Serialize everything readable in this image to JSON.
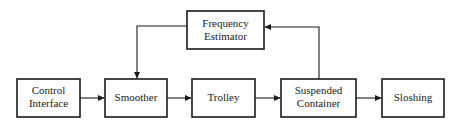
{
  "diagram": {
    "type": "block-diagram",
    "colors": {
      "stroke": "#1a1a1a",
      "text": "#222222",
      "background": "#ffffff"
    },
    "blocks": [
      {
        "id": "control_interface",
        "lines": [
          "Control",
          "Interface"
        ]
      },
      {
        "id": "smoother",
        "lines": [
          "Smoother"
        ]
      },
      {
        "id": "trolley",
        "lines": [
          "Trolley"
        ]
      },
      {
        "id": "suspended_container",
        "lines": [
          "Suspended",
          "Container"
        ]
      },
      {
        "id": "sloshing",
        "lines": [
          "Sloshing"
        ]
      },
      {
        "id": "frequency_estimator",
        "lines": [
          "Frequency",
          "Estimator"
        ]
      }
    ],
    "edges": [
      {
        "from": "control_interface",
        "to": "smoother"
      },
      {
        "from": "smoother",
        "to": "trolley"
      },
      {
        "from": "trolley",
        "to": "suspended_container"
      },
      {
        "from": "suspended_container",
        "to": "sloshing"
      },
      {
        "from": "suspended_container",
        "to": "frequency_estimator"
      },
      {
        "from": "frequency_estimator",
        "to": "smoother"
      }
    ]
  }
}
